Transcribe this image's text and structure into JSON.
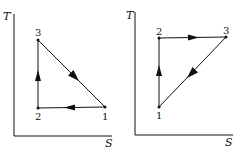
{
  "diagrams": [
    {
      "name": "ts-diagram-left",
      "y_axis_label": "T",
      "x_axis_label": "S",
      "points": [
        {
          "label": "1",
          "x": 105,
          "y": 107
        },
        {
          "label": "2",
          "x": 38,
          "y": 108
        },
        {
          "label": "3",
          "x": 38,
          "y": 40
        }
      ],
      "process_path": [
        "1",
        "2",
        "3",
        "1"
      ]
    },
    {
      "name": "ts-diagram-right",
      "y_axis_label": "T",
      "x_axis_label": "S",
      "points": [
        {
          "label": "1",
          "x": 159,
          "y": 107
        },
        {
          "label": "2",
          "x": 159,
          "y": 38
        },
        {
          "label": "3",
          "x": 226,
          "y": 37
        }
      ],
      "process_path": [
        "1",
        "2",
        "3",
        "1"
      ]
    }
  ],
  "colors": {
    "ink": "#111111",
    "background": "#ffffff"
  }
}
